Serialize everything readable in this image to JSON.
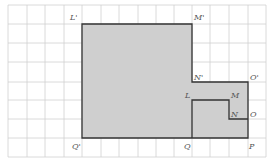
{
  "diagram": {
    "grid": {
      "x_lines": [
        8,
        27,
        45,
        64,
        82,
        101,
        119,
        138,
        156,
        174,
        192,
        210,
        229,
        248,
        266
      ],
      "y_lines": [
        5,
        24,
        43,
        62,
        82,
        100,
        119,
        138,
        157
      ],
      "color": "#d0d0d0"
    },
    "shape": {
      "fill": "#cfcfcf",
      "stroke": "#333333",
      "outline_points": "82,24 192,24 192,82 248,82 248,138 82,138",
      "inner_path_points": "192,138 192,100 229,100 229,119 248,119"
    },
    "labels": [
      {
        "text": "L'",
        "x": 70,
        "y": 20
      },
      {
        "text": "M'",
        "x": 194,
        "y": 20
      },
      {
        "text": "N'",
        "x": 194,
        "y": 80
      },
      {
        "text": "O'",
        "x": 250,
        "y": 80
      },
      {
        "text": "L",
        "x": 185,
        "y": 98
      },
      {
        "text": "M",
        "x": 231,
        "y": 98
      },
      {
        "text": "N",
        "x": 231,
        "y": 117
      },
      {
        "text": "O",
        "x": 250,
        "y": 117
      },
      {
        "text": "Q'",
        "x": 72,
        "y": 149
      },
      {
        "text": "Q",
        "x": 184,
        "y": 149
      },
      {
        "text": "P",
        "x": 249,
        "y": 149
      }
    ]
  }
}
